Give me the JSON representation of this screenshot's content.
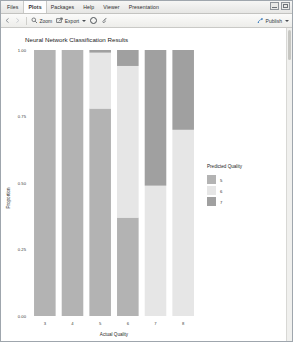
{
  "window": {
    "tabs": [
      {
        "label": "Files",
        "active": false
      },
      {
        "label": "Plots",
        "active": true
      },
      {
        "label": "Packages",
        "active": false
      },
      {
        "label": "Help",
        "active": false
      },
      {
        "label": "Viewer",
        "active": false
      },
      {
        "label": "Presentation",
        "active": false
      }
    ],
    "controls": [
      {
        "name": "minimize-button",
        "icon": "minimize-icon"
      },
      {
        "name": "maximize-button",
        "icon": "maximize-icon"
      }
    ]
  },
  "toolbar": {
    "back_icon": "back-arrow-icon",
    "forward_icon": "forward-arrow-icon",
    "zoom_label": "Zoom",
    "zoom_icon": "magnifier-icon",
    "export_label": "Export",
    "export_icon": "export-icon",
    "export_caret": "chevron-down-icon",
    "remove_icon": "remove-plot-icon",
    "clear_icon": "broom-icon",
    "publish_label": "Publish",
    "publish_icon": "publish-icon",
    "publish_caret": "chevron-down-icon"
  },
  "chart_data": {
    "type": "bar",
    "stacked": true,
    "stack_mode": "fill",
    "title": "Neural Network Classification Results",
    "xlabel": "Actual Quality",
    "ylabel": "Proportion",
    "categories": [
      "3",
      "4",
      "5",
      "6",
      "7",
      "8"
    ],
    "ylim": [
      0,
      1
    ],
    "yticks": [
      "0.00",
      "0.25",
      "0.50",
      "0.75",
      "1.00"
    ],
    "ytick_values": [
      0,
      0.25,
      0.5,
      0.75,
      1
    ],
    "grid": false,
    "legend_title": "Predicted Quality",
    "legend_position": "right",
    "series": [
      {
        "name": "5",
        "color": "#b3b3b3",
        "values": [
          1.0,
          1.0,
          0.78,
          0.37,
          0.0,
          0.0
        ]
      },
      {
        "name": "6",
        "color": "#e6e6e6",
        "values": [
          0.0,
          0.0,
          0.21,
          0.57,
          0.49,
          0.7
        ]
      },
      {
        "name": "7",
        "color": "#a0a0a0",
        "values": [
          0.0,
          0.0,
          0.01,
          0.06,
          0.51,
          0.3
        ]
      }
    ],
    "panel_background": "#ffffff"
  }
}
